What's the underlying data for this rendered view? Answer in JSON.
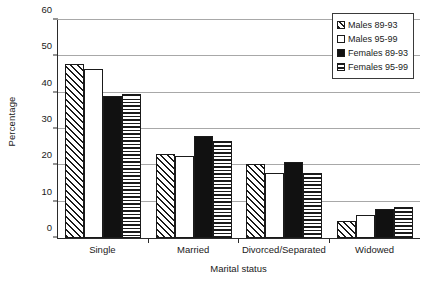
{
  "chart_data": {
    "type": "bar",
    "title": "",
    "subtitle": "",
    "xlabel": "Marital status",
    "ylabel": "Percentage",
    "categories": [
      "Single",
      "Married",
      "Divorced/Separated",
      "Widowed"
    ],
    "series": [
      {
        "name": "Males 89-93",
        "pattern": "diagonal-hatch",
        "values": [
          48.0,
          23.1,
          20.4,
          4.8
        ]
      },
      {
        "name": "Males 95-99",
        "pattern": "white-fill",
        "values": [
          46.4,
          22.6,
          17.9,
          6.2
        ]
      },
      {
        "name": "Females 89-93",
        "pattern": "solid-black",
        "values": [
          39.2,
          28.2,
          20.8,
          7.9
        ]
      },
      {
        "name": "Females 95-99",
        "pattern": "horizontal-lines",
        "values": [
          39.5,
          26.7,
          18.0,
          8.4
        ]
      }
    ],
    "ylim": [
      0,
      60
    ],
    "yticks": [
      0,
      10,
      20,
      30,
      40,
      50,
      60
    ],
    "ytick_labels": [
      "0",
      "10",
      "20",
      "30",
      "40",
      "50",
      "60"
    ],
    "grid": "horizontal",
    "legend_position": "top-right",
    "colors": {
      "axis": "#2b2b2b",
      "gridline": "#a8a8a8",
      "bar_outline": "#1a1a1a",
      "bar_solid": "#111111",
      "bar_background": "#ffffff",
      "plot_background": "#ffffff"
    }
  },
  "legend": {
    "entries": [
      {
        "label": "Males 89-93"
      },
      {
        "label": "Males 95-99"
      },
      {
        "label": "Females 89-93"
      },
      {
        "label": "Females 95-99"
      }
    ]
  }
}
